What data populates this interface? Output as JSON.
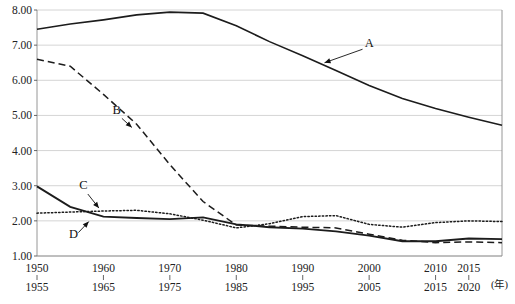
{
  "chart_data": {
    "type": "line",
    "title": "",
    "xlabel": "(年)",
    "ylabel": "",
    "ylim": [
      1.0,
      8.0
    ],
    "ytick_step": 1.0,
    "grid": true,
    "legend_position": "inline-annotations",
    "yticks": [
      "1.00",
      "2.00",
      "3.00",
      "4.00",
      "5.00",
      "6.00",
      "7.00",
      "8.00"
    ],
    "xticks_top": [
      "1950",
      "1960",
      "1970",
      "1980",
      "1990",
      "2000",
      "2010",
      "2015"
    ],
    "xticks_bottom": [
      "1955",
      "1965",
      "1975",
      "1985",
      "1995",
      "2005",
      "2015",
      "2020"
    ],
    "x": [
      1950,
      1955,
      1960,
      1965,
      1970,
      1975,
      1980,
      1985,
      1990,
      1995,
      2000,
      2005,
      2010,
      2015,
      2020
    ],
    "series": [
      {
        "name": "A",
        "label": "A",
        "style": "solid",
        "values": [
          7.45,
          7.6,
          7.72,
          7.86,
          7.94,
          7.91,
          7.55,
          7.1,
          6.7,
          6.28,
          5.85,
          5.48,
          5.2,
          4.95,
          4.72
        ]
      },
      {
        "name": "B",
        "label": "B",
        "style": "dashed",
        "values": [
          6.6,
          6.4,
          5.6,
          4.75,
          3.6,
          2.55,
          1.88,
          1.85,
          1.82,
          1.8,
          1.62,
          1.45,
          1.38,
          1.4,
          1.38
        ]
      },
      {
        "name": "C",
        "label": "C",
        "style": "dotted",
        "values": [
          2.22,
          2.25,
          2.28,
          2.3,
          2.2,
          2.02,
          1.8,
          1.92,
          2.12,
          2.15,
          1.9,
          1.82,
          1.95,
          2.0,
          1.98
        ]
      },
      {
        "name": "D",
        "label": "D",
        "style": "solid-thick",
        "values": [
          2.98,
          2.4,
          2.12,
          2.08,
          2.05,
          2.1,
          1.9,
          1.82,
          1.78,
          1.7,
          1.58,
          1.42,
          1.42,
          1.5,
          1.48
        ]
      }
    ],
    "annotations": [
      {
        "label": "A",
        "points_to_series": "A",
        "label_x": 2000,
        "label_y": 6.95,
        "target_x": 1993,
        "target_y": 6.48
      },
      {
        "label": "B",
        "points_to_series": "B",
        "label_x": 1962,
        "label_y": 5.05,
        "target_x": 1964.5,
        "target_y": 4.62
      },
      {
        "label": "C",
        "points_to_series": "C",
        "label_x": 1957,
        "label_y": 2.92,
        "target_x": 1959.5,
        "target_y": 2.32
      },
      {
        "label": "D",
        "points_to_series": "D",
        "label_x": 1955.5,
        "label_y": 1.52,
        "target_x": 1958,
        "target_y": 2.02
      }
    ],
    "footnote": ""
  }
}
